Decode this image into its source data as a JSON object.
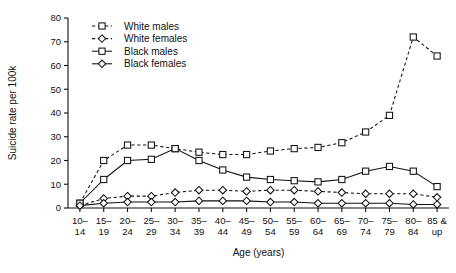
{
  "chart_data": {
    "type": "line",
    "title": "",
    "xlabel": "Age (years)",
    "ylabel": "Suicide rate per 100k",
    "categories": [
      "10–\n14",
      "15–\n19",
      "20–\n24",
      "25–\n29",
      "30–\n34",
      "35–\n39",
      "40–\n44",
      "45–\n49",
      "50–\n54",
      "55–\n59",
      "60–\n64",
      "65–\n69",
      "70–\n74",
      "75–\n79",
      "80–\n84",
      "85 &\nup"
    ],
    "categories_line1": [
      "10–",
      "15–",
      "20–",
      "25–",
      "30–",
      "35–",
      "40–",
      "45–",
      "50–",
      "55–",
      "60–",
      "65–",
      "70–",
      "75–",
      "80–",
      "85 &"
    ],
    "categories_line2": [
      "14",
      "19",
      "24",
      "29",
      "34",
      "39",
      "44",
      "49",
      "54",
      "59",
      "64",
      "69",
      "74",
      "79",
      "84",
      "up"
    ],
    "ylim": [
      0,
      80
    ],
    "yticks": [
      0,
      10,
      20,
      30,
      40,
      50,
      60,
      70,
      80
    ],
    "grid": false,
    "legend_position": "top-left-inside",
    "series": [
      {
        "name": "White males",
        "marker": "square",
        "linestyle": "dashed",
        "color": "#111111",
        "values": [
          2,
          20,
          26.5,
          26.5,
          25,
          23.5,
          22.5,
          22.5,
          24,
          25,
          25.5,
          27.5,
          32,
          39,
          72,
          64
        ]
      },
      {
        "name": "White females",
        "marker": "diamond",
        "linestyle": "dashed",
        "color": "#111111",
        "values": [
          1,
          4,
          5,
          5,
          6.5,
          7.5,
          7.5,
          7,
          7.5,
          7.5,
          7,
          6.5,
          6,
          6,
          6,
          4.5
        ]
      },
      {
        "name": "Black males",
        "marker": "square",
        "linestyle": "solid",
        "color": "#111111",
        "values": [
          2,
          12,
          20,
          20.5,
          25,
          20,
          16,
          13,
          12,
          11.5,
          11,
          12,
          15.5,
          17.5,
          15.5,
          9
        ]
      },
      {
        "name": "Black females",
        "marker": "diamond",
        "linestyle": "solid",
        "color": "#111111",
        "values": [
          1,
          2,
          2.5,
          2.5,
          2.5,
          3,
          3,
          3,
          2.5,
          2.5,
          2,
          2,
          2,
          2,
          1.5,
          1.5
        ]
      }
    ]
  },
  "legend": {
    "entries": [
      {
        "label": "White males"
      },
      {
        "label": "White females"
      },
      {
        "label": "Black males"
      },
      {
        "label": "Black females"
      }
    ]
  }
}
